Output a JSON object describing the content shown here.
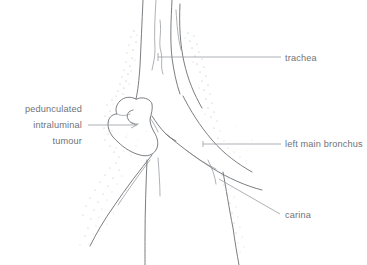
{
  "figure": {
    "background_color": "#ffffff",
    "line_color": "#6b6e73",
    "leader_color": "#9a9da2",
    "text_color": "#6f7276",
    "stipple_color": "#a9acb1"
  },
  "labels": [
    {
      "id": "trachea",
      "text": "trachea",
      "x": 285,
      "y": 61,
      "align": "left-align",
      "leader": {
        "x1": 158,
        "y1": 57,
        "x2": 281,
        "y2": 57
      }
    },
    {
      "id": "left-main-bronchus",
      "text": "left main bronchus",
      "x": 285,
      "y": 147,
      "align": "left-align",
      "leader": {
        "x1": 203,
        "y1": 144,
        "x2": 281,
        "y2": 144
      }
    },
    {
      "id": "carina",
      "text": "carina",
      "x": 285,
      "y": 218,
      "align": "left-align",
      "leader": {
        "x1": 219,
        "y1": 179,
        "x2": 280,
        "y2": 214
      }
    },
    {
      "id": "tumour",
      "text_lines": [
        "pedunculated",
        "intraluminal",
        "tumour"
      ],
      "x": 82,
      "y": 112,
      "line_height": 13.5,
      "align": "right-align",
      "leader": {
        "x1": 88,
        "y1": 125,
        "x2": 136,
        "y2": 125
      }
    }
  ],
  "label_text": {
    "trachea": "trachea",
    "left_main_bronchus": "left main bronchus",
    "carina": "carina",
    "tumour_line1": "pedunculated",
    "tumour_line2": "intraluminal",
    "tumour_line3": "tumour"
  },
  "anatomy": {
    "structures": [
      "trachea anterior wall",
      "trachea posterior wall",
      "trachea inner lumen lines",
      "carina",
      "left main bronchus",
      "right main bronchus",
      "pedunculated intraluminal tumour"
    ]
  }
}
